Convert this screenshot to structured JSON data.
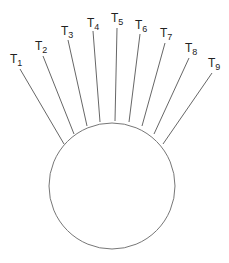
{
  "diagram": {
    "circle": {
      "cx": 112,
      "cy": 186,
      "r": 63,
      "stroke": "#777777"
    },
    "line_color": "#555555",
    "lines": [
      {
        "label": "T",
        "sub": "1",
        "x1": 64,
        "y1": 144,
        "x2": 20,
        "y2": 69,
        "lx": 10,
        "ly": 63
      },
      {
        "label": "T",
        "sub": "2",
        "x1": 74,
        "y1": 134,
        "x2": 43,
        "y2": 56,
        "lx": 35,
        "ly": 50
      },
      {
        "label": "T",
        "sub": "3",
        "x1": 87,
        "y1": 126,
        "x2": 68,
        "y2": 40,
        "lx": 61,
        "ly": 35
      },
      {
        "label": "T",
        "sub": "4",
        "x1": 100,
        "y1": 122,
        "x2": 93,
        "y2": 31,
        "lx": 87,
        "ly": 27
      },
      {
        "label": "T",
        "sub": "5",
        "x1": 115,
        "y1": 121,
        "x2": 117,
        "y2": 28,
        "lx": 111,
        "ly": 22
      },
      {
        "label": "T",
        "sub": "6",
        "x1": 129,
        "y1": 122,
        "x2": 140,
        "y2": 34,
        "lx": 135,
        "ly": 29
      },
      {
        "label": "T",
        "sub": "7",
        "x1": 142,
        "y1": 126,
        "x2": 165,
        "y2": 43,
        "lx": 160,
        "ly": 37
      },
      {
        "label": "T",
        "sub": "8",
        "x1": 154,
        "y1": 134,
        "x2": 189,
        "y2": 58,
        "lx": 185,
        "ly": 52
      },
      {
        "label": "T",
        "sub": "9",
        "x1": 163,
        "y1": 144,
        "x2": 212,
        "y2": 73,
        "lx": 208,
        "ly": 67
      }
    ]
  }
}
